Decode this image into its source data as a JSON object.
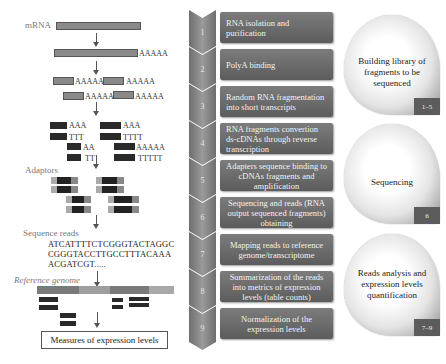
{
  "workflow": {
    "mrna_label": "mRNA",
    "polya_tail": "AAAAA",
    "fragment_tails": [
      "AAAAA",
      "AAAAA",
      "AAAAA",
      "AAAAA"
    ],
    "cdna_tails": [
      "AAA",
      "TTT",
      "AA",
      "TT",
      "AAA",
      "TTTT",
      "AAAAA",
      "TTTTT"
    ],
    "adaptors_label": "Adaptors",
    "sequence_reads_label": "Sequence reads",
    "sequence_reads": [
      "ATCATTTTCTCGGGTACTAGGC",
      "CGGGTACCTTGCCTTTACAAA",
      "ACGATCGT....."
    ],
    "reference_genome_label": "Reference genome",
    "measures_label": "Measures of expression levels"
  },
  "steps": [
    {
      "number": "1",
      "text": "RNA isolation and purification"
    },
    {
      "number": "2",
      "text": "PolyA binding"
    },
    {
      "number": "3",
      "text": "Random RNA fragmentation into short transcripts"
    },
    {
      "number": "4",
      "text": "RNA fragments convertion ds-cDNAs through reverse transcription"
    },
    {
      "number": "5",
      "text": "Adapters sequence binding to cDNAs fragments and amplification"
    },
    {
      "number": "6",
      "text": "Sequencing and reads (RNA output sequenced fragments) obtaining"
    },
    {
      "number": "7",
      "text": "Mapping reads to reference genome/transcriptome"
    },
    {
      "number": "8",
      "text": "Summarization of the reads into metrics of expression levels (table counts)"
    },
    {
      "number": "9",
      "text": "Normalization of the expression levels"
    }
  ],
  "phases": [
    {
      "title": "Building library of fragments to be sequenced",
      "range": "1–5"
    },
    {
      "title": "Sequencing",
      "range": "6"
    },
    {
      "title": "Reads analysis and expression levels quantification",
      "range": "7–9"
    }
  ],
  "colors": {
    "step_box": "#6a6a6a",
    "chevron": "#808080",
    "dark_fragment": "#2a2a2a",
    "bar_gray": "#8a8a8a"
  }
}
